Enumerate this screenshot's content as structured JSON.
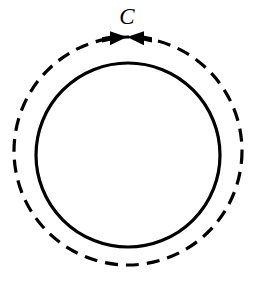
{
  "figure": {
    "canvas": {
      "width": 255,
      "height": 281,
      "background": "#ffffff"
    },
    "stroke_color": "#000000",
    "labels": {
      "contour": "C"
    },
    "label_positions": {
      "contour": {
        "x": 127,
        "y": 24,
        "font_size": 23
      }
    },
    "shapes": {
      "outer_dashed_circle": {
        "name": "contour-path",
        "cx": 128,
        "cy": 151,
        "r": 114,
        "stroke": "#000000",
        "stroke_width": 3.2,
        "dash": "13 8",
        "fill": "none",
        "style": "dashed"
      },
      "inner_solid_circle": {
        "name": "region-boundary",
        "cx": 128,
        "cy": 155,
        "r": 92,
        "stroke": "#000000",
        "stroke_width": 3.2,
        "fill": "none",
        "style": "solid"
      }
    },
    "direction_marker": {
      "name": "orientation-arrows",
      "description": "two arrowheads meeting at the top of the dashed contour",
      "center_x": 127,
      "center_y": 38,
      "half_span": 25,
      "head_length": 17,
      "head_half_height": 7,
      "tail_height": 2.6,
      "fill": "#000000",
      "left_arrow_points_right": true,
      "right_arrow_points_left": true
    }
  }
}
